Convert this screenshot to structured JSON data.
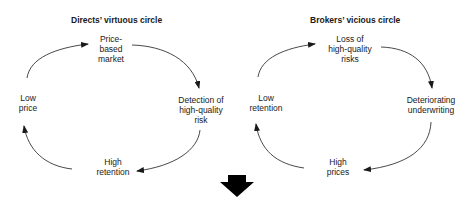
{
  "diagrams": [
    {
      "title": "Directs’ virtuous circle",
      "nodes": {
        "top": "Price-\nbased\nmarket",
        "right": "Detection  of\nhigh-quality\nrisk",
        "bottom": "High\nretention",
        "left": "Low\nprice"
      },
      "flow": [
        "Price-based market",
        "Detection of high-quality risk",
        "High retention",
        "Low price",
        "Price-based market"
      ]
    },
    {
      "title": "Brokers’ vicious circle",
      "nodes": {
        "top": "Loss of\nhigh-quality\nrisks",
        "right": "Deteriorating\nunderwriting",
        "bottom": "High\nprices",
        "left": "Low\nretention"
      },
      "flow": [
        "Loss of high-quality risks",
        "Deteriorating underwriting",
        "High prices",
        "Low retention",
        "Loss of high-quality risks"
      ]
    }
  ],
  "connector": {
    "icon": "down-arrow-icon",
    "color": "#000000"
  },
  "colors": {
    "line": "#1a1a1a",
    "background": "#ffffff"
  }
}
